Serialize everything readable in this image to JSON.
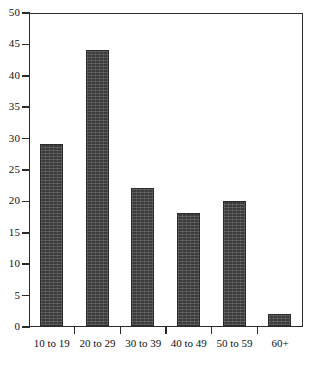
{
  "chart_data": {
    "type": "bar",
    "title": "",
    "subtitle": "",
    "xlabel": "",
    "ylabel": "",
    "categories": [
      "10 to 19",
      "20 to 29",
      "30 to 39",
      "40 to 49",
      "50 to 59",
      "60+"
    ],
    "values": [
      29,
      44,
      22,
      18,
      20,
      2
    ],
    "ylim": [
      0,
      50
    ],
    "ytick_step": 5,
    "ytick_labels": [
      "0",
      "5",
      "10",
      "15",
      "20",
      "25",
      "30",
      "35",
      "40",
      "45",
      "50"
    ],
    "grid": false,
    "legend": null,
    "legend_position": "none",
    "bar_color": "#3b3b3b",
    "bar_edge_color": "#2a2a2a",
    "axis_color": "#2b2b2b",
    "background_color": "#ffffff",
    "annotations": []
  }
}
